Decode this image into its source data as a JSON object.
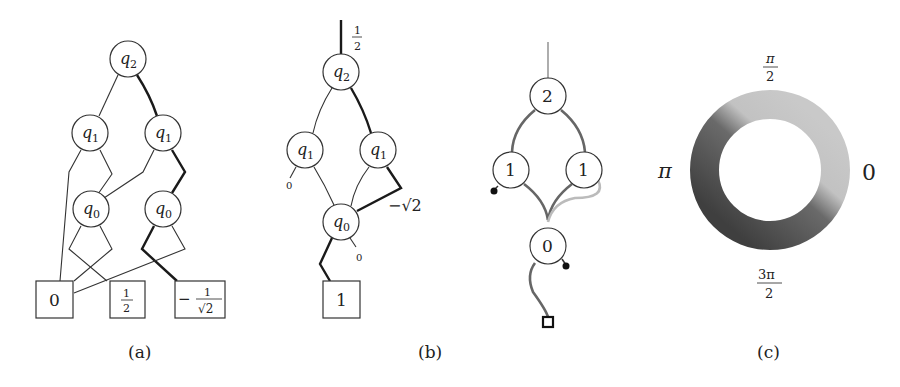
{
  "panels": {
    "a": {
      "caption": "(a)",
      "nodes": {
        "q2": "q",
        "q2_sub": "2",
        "q1": "q",
        "q1_sub": "1",
        "q0": "q",
        "q0_sub": "0"
      },
      "terminals": {
        "zero": "0",
        "half_num": "1",
        "half_den": "2",
        "neg_sign": "−",
        "inv_sqrt2_num": "1",
        "inv_sqrt2_den": "√2"
      }
    },
    "b": {
      "caption": "(b)",
      "root_weight_num": "1",
      "root_weight_den": "2",
      "nodes": {
        "q2": "q",
        "q2_sub": "2",
        "q1": "q",
        "q1_sub": "1",
        "q0": "q",
        "q0_sub": "0"
      },
      "edge_weight": "−√2",
      "zero_stub": "0",
      "terminal": "1"
    },
    "middle": {
      "nodes": {
        "top": "2",
        "mid_left": "1",
        "mid_right": "1",
        "bottom": "0"
      }
    },
    "c": {
      "caption": "(c)",
      "labels": {
        "top_num": "π",
        "top_den": "2",
        "left": "π",
        "right": "0",
        "bottom_num": "3π",
        "bottom_den": "2"
      },
      "colors": {
        "light": "#c4c4c4",
        "dark": "#4a4a4a"
      }
    }
  }
}
